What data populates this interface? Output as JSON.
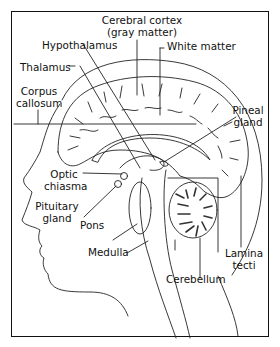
{
  "diagram": {
    "type": "anatomical-illustration",
    "labels": {
      "cerebral_cortex_1": "Cerebral cortex",
      "cerebral_cortex_2": "(gray matter)",
      "hypothalamus": "Hypothalamus",
      "white_matter": "White matter",
      "thalamus": "Thalamus",
      "corpus_callosum_1": "Corpus",
      "corpus_callosum_2": "callosum",
      "pineal_gland_1": "Pineal",
      "pineal_gland_2": "gland",
      "optic_chiasma_1": "Optic",
      "optic_chiasma_2": "chiasma",
      "pituitary_gland_1": "Pituitary",
      "pituitary_gland_2": "gland",
      "pons": "Pons",
      "medulla": "Medulla",
      "lamina_tecti_1": "Lamina",
      "lamina_tecti_2": "tecti",
      "cerebellum": "Cerebellum"
    },
    "colors": {
      "line": "#111111",
      "background": "#ffffff"
    }
  }
}
